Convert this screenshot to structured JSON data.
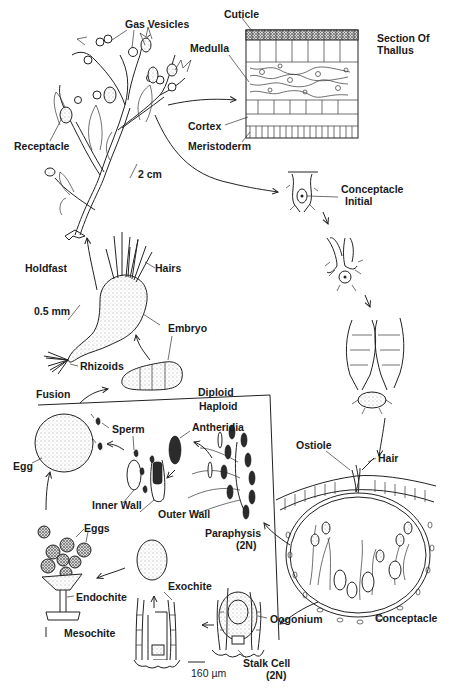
{
  "diagram": {
    "ink_color": "#222222",
    "background": "#ffffff",
    "sections": {
      "upper_region_label": "Diploid",
      "lower_region_label": "Haploid"
    },
    "labels": {
      "gas_vesicles": "Gas Vesicles",
      "cuticle": "Cuticle",
      "medulla": "Medulla",
      "section_of_thallus_1": "Section Of",
      "section_of_thallus_2": "Thallus",
      "cortex": "Cortex",
      "meristoderm": "Meristoderm",
      "receptacle": "Receptacle",
      "scale_2cm": "2 cm",
      "conceptacle_initial_1": "Conceptacle",
      "conceptacle_initial_2": "Initial",
      "holdfast": "Holdfast",
      "hairs": "Hairs",
      "scale_05mm": "0.5 mm",
      "embryo": "Embryo",
      "rhizoids": "Rhizoids",
      "fusion": "Fusion",
      "diploid": "Diploid",
      "haploid": "Haploid",
      "sperm": "Sperm",
      "antheridia": "Antheridia",
      "egg": "Egg",
      "inner_wall": "Inner Wall",
      "outer_wall": "Outer Wall",
      "ostiole": "Ostiole",
      "hair": "Hair",
      "paraphysis": "Paraphysis",
      "paraphysis_ploidy": "(2N)",
      "eggs": "Eggs",
      "endochite": "Endochite",
      "exochite": "Exochite",
      "mesochite": "Mesochite",
      "oogonium": "Oogonium",
      "conceptacle": "Conceptacle",
      "stalk_cell": "Stalk Cell",
      "stalk_cell_ploidy": "(2N)",
      "scale_160um": "160 µm"
    }
  }
}
